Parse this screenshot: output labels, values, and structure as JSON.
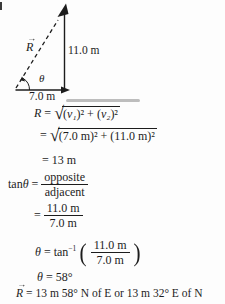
{
  "diagram": {
    "resultant": {
      "letter": "R",
      "arrow": "→"
    },
    "angle_label": "θ",
    "vertical_value": "11.0 m",
    "horizontal_value": "7.0 m"
  },
  "solution": {
    "line1": {
      "lhs": "R",
      "equals": "=",
      "rad": {
        "p1": "(",
        "v1": "v₁",
        "p2": ")² + (",
        "v2": "v₂",
        "p3": ")²"
      }
    },
    "line2": {
      "equals": "=",
      "radicand": "(7.0 m)² + (11.0 m)²"
    },
    "line3": {
      "equals": "=",
      "value": "13 m"
    },
    "line4": {
      "func": "tan",
      "theta": "θ",
      "equals": "=",
      "num": "opposite",
      "den": "adjacent"
    },
    "line5": {
      "equals": "=",
      "num": "11.0 m",
      "den": "7.0 m"
    },
    "line6": {
      "theta": "θ",
      "equals": "=",
      "func": "tan",
      "exp": "−1",
      "paren_open": "(",
      "num": "11.0 m",
      "den": "7.0 m",
      "paren_close": ")"
    },
    "line7": {
      "theta": "θ",
      "equals": "=",
      "value": "58°"
    },
    "line8": {
      "vector": {
        "letter": "R",
        "arrow": "→"
      },
      "equals": "=",
      "value": "13 m 58° N of E or 13 m 32° E of N"
    }
  }
}
